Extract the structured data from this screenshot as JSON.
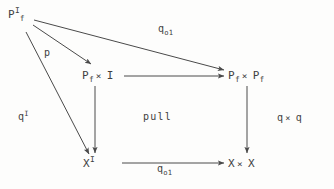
{
  "figure": {
    "kind": "commutative-diagram",
    "background_color": "#fdfdfc",
    "ink_color": "#3f3f3f",
    "nodes": [
      {
        "id": "pf-i",
        "base": "P",
        "sub": "f",
        "sup": "I",
        "label": "P_f^I"
      },
      {
        "id": "pf-times-i",
        "base": "P",
        "sub": "f",
        "sup": "",
        "operator": "×",
        "operand": "I",
        "label": "P_f × I"
      },
      {
        "id": "pf-times-pf",
        "base": "P",
        "sub": "f",
        "sup": "",
        "operator": "×",
        "operand": "P",
        "operand_sub": "f",
        "label": "P_f × P_f"
      },
      {
        "id": "x-i",
        "base": "X",
        "sub": "",
        "sup": "I",
        "label": "X^I"
      },
      {
        "id": "x-times-x",
        "base": "X",
        "sub": "",
        "sup": "",
        "operator": "×",
        "operand": "X",
        "label": "X × X"
      }
    ],
    "edge_labels": [
      {
        "id": "q01-top",
        "base": "q",
        "sub": "o1",
        "label": "q_o1"
      },
      {
        "id": "p",
        "base": "p",
        "sub": "",
        "label": "p"
      },
      {
        "id": "q-i",
        "base": "q",
        "sup": "I",
        "label": "q^I"
      },
      {
        "id": "q-times-q",
        "base": "q",
        "operator": "×",
        "operand": "q",
        "label": "q × q"
      },
      {
        "id": "q01-bottom",
        "base": "q",
        "sub": "o1",
        "label": "q_o1"
      }
    ],
    "annotations": [
      {
        "id": "pull",
        "text": "pull"
      }
    ]
  }
}
